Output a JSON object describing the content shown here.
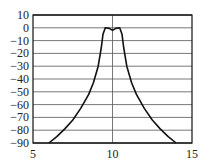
{
  "chart_data": {
    "type": "line",
    "title": "",
    "xlabel": "",
    "ylabel": "",
    "xlim": [
      5,
      15
    ],
    "ylim": [
      -90,
      10
    ],
    "grid": {
      "horizontal": true,
      "vertical_center": true
    },
    "x_ticks": [
      "5",
      "10",
      "15"
    ],
    "y_ticks": [
      "10",
      "0",
      "−10",
      "−20",
      "−30",
      "−40",
      "−50",
      "−60",
      "−70",
      "−80",
      "−90"
    ],
    "series": [
      {
        "name": "response",
        "x": [
          6.0,
          6.5,
          7.0,
          7.5,
          8.0,
          8.5,
          8.8,
          9.1,
          9.3,
          9.4,
          9.55,
          9.8,
          10.0,
          10.2,
          10.45,
          10.6,
          10.7,
          10.9,
          11.2,
          11.5,
          12.0,
          12.5,
          13.0,
          13.5,
          14.0
        ],
        "y": [
          -90,
          -85,
          -79,
          -72,
          -63,
          -52,
          -43,
          -30,
          -15,
          -5,
          0,
          -0.5,
          -2,
          -0.5,
          0,
          -5,
          -15,
          -30,
          -43,
          -52,
          -63,
          -72,
          -79,
          -85,
          -90
        ]
      }
    ],
    "colors": {
      "line": "#111111",
      "grid": "#555555",
      "frame": "#111111"
    }
  }
}
